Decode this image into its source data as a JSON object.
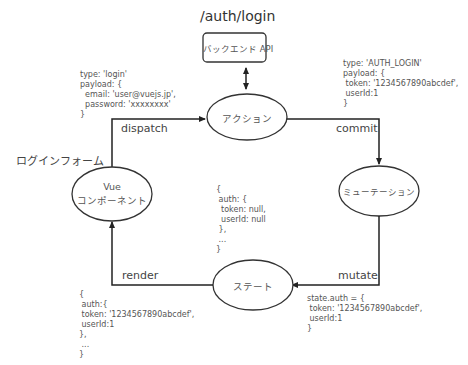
{
  "diagram": {
    "endpoint_label": "/auth/login",
    "nodes": {
      "backend": {
        "label": "バックエンド API"
      },
      "action": {
        "label": "アクション"
      },
      "mutation": {
        "label": "ミューテーション"
      },
      "state": {
        "label": "ステート"
      },
      "vue": {
        "label_line1": "Vue",
        "label_line2": "コンポーネント"
      }
    },
    "side_labels": {
      "login_form": "ログインフォーム"
    },
    "edges": {
      "dispatch": "dispatch",
      "commit": "commit",
      "mutate": "mutate",
      "render": "render"
    },
    "code_blocks": {
      "dispatch_payload": "type: 'login'\npayload: {\n  email: 'user@vuejs.jp',\n  password: 'xxxxxxxx'\n}",
      "commit_payload": "type: 'AUTH_LOGIN'\npayload: {\n token: '1234567890abcdef',\n userId:1\n}",
      "initial_state": "{\n auth: {\n  token: null,\n  userId: null\n },\n ...\n}",
      "mutate_code": "state.auth = {\n token: '1234567890abcdef',\n userId:1\n}",
      "render_state": "{\n auth:{\n token: '1234567890abcdef',\n userId:1\n},\n ...\n}"
    },
    "colors": {
      "stroke": "#333333",
      "text": "#555555"
    }
  }
}
